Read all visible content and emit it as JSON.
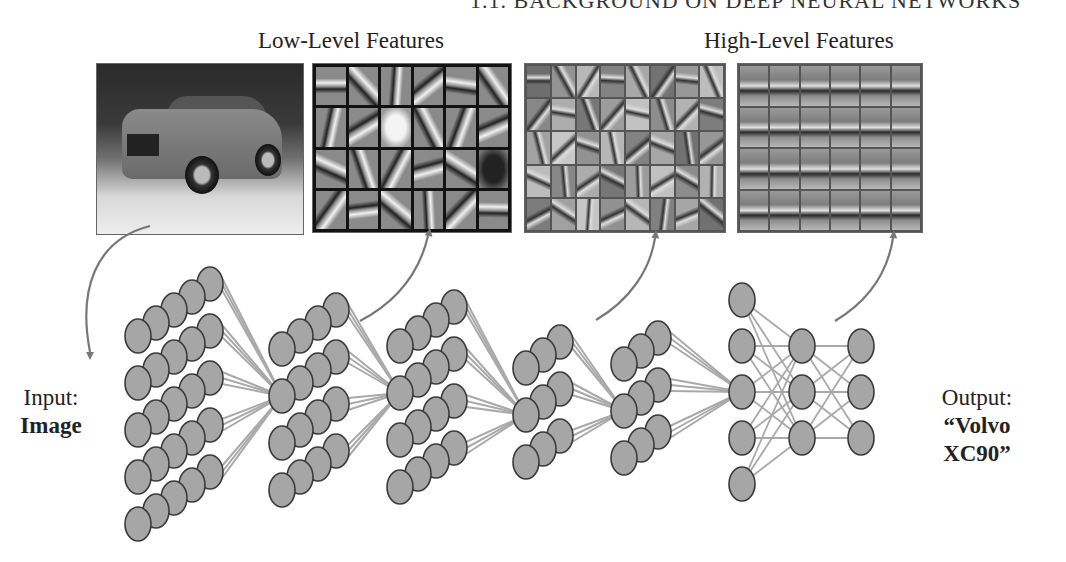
{
  "running_header": "1.1. BACKGROUND ON DEEP NEURAL NETWORKS",
  "labels": {
    "low_level": "Low-Level Features",
    "high_level": "High-Level Features"
  },
  "input": {
    "line1": "Input:",
    "line2": "Image"
  },
  "output": {
    "line1": "Output:",
    "line2": "“Volvo XC90”"
  },
  "panels": [
    {
      "name": "input-image",
      "description": "photo of Volvo XC90 car"
    },
    {
      "name": "low-level-features",
      "grid": "6x4",
      "description": "edge / gabor-like filters"
    },
    {
      "name": "mid-level-features",
      "grid": "8x5",
      "description": "part-like patterns"
    },
    {
      "name": "high-level-features",
      "grid": "6x4",
      "description": "car-like patterns"
    }
  ],
  "network": {
    "layers": [
      {
        "type": "conv-block",
        "depth": 5,
        "rows": 5
      },
      {
        "type": "conv-block",
        "depth": 4,
        "rows": 4
      },
      {
        "type": "conv-block",
        "depth": 4,
        "rows": 4
      },
      {
        "type": "conv-block",
        "depth": 3,
        "rows": 3
      },
      {
        "type": "conv-block",
        "depth": 3,
        "rows": 3
      },
      {
        "type": "fully-connected",
        "nodes": 5
      },
      {
        "type": "fully-connected",
        "nodes": 3
      },
      {
        "type": "fully-connected",
        "nodes": 3
      }
    ]
  },
  "colors": {
    "node_fill": "#a6a6a6",
    "node_stroke": "#3a3a3a",
    "edge": "#a9a9a9",
    "arrow": "#777777"
  }
}
